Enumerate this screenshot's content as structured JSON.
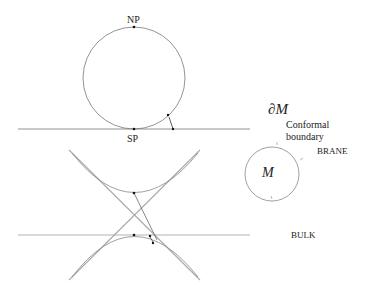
{
  "figure": {
    "top_panel": {
      "labels": {
        "north_pole": "NP",
        "south_pole": "SP"
      }
    },
    "right_panel": {
      "labels": {
        "boundary_symbol": "∂M",
        "conformal_boundary_line1": "Conformal",
        "conformal_boundary_line2": "boundary",
        "brane": "BRANE",
        "manifold": "M",
        "bulk": "BULK"
      }
    },
    "caption_fragment": ""
  },
  "colors": {
    "stroke": "#666666",
    "light_stroke": "#aaaaaa",
    "dot": "#111111",
    "text": "#222222"
  }
}
